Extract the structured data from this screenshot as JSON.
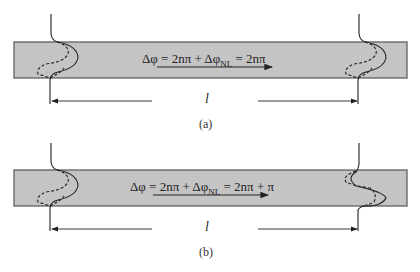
{
  "panels": [
    {
      "id": "a",
      "caption": "(a)",
      "equation": {
        "lhs": "Δφ = 2nπ + Δφ",
        "sub": "NL",
        "rhs": " = 2nπ"
      },
      "length_label": "l",
      "output_profile": "same_as_input"
    },
    {
      "id": "b",
      "caption": "(b)",
      "equation": {
        "lhs": "Δφ = 2nπ + Δφ",
        "sub": "NL",
        "rhs": " = 2nπ + π"
      },
      "length_label": "l",
      "output_profile": "inverted"
    }
  ],
  "colors": {
    "waveguide_fill": "#c4c4c4",
    "waveguide_border": "#555555",
    "line": "#222222"
  }
}
